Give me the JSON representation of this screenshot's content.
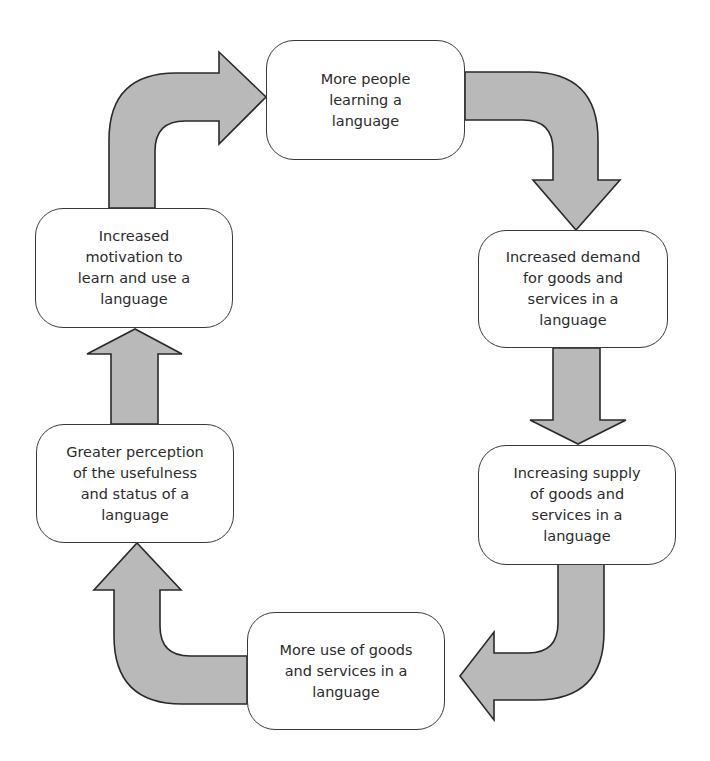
{
  "diagram": {
    "type": "cycle",
    "nodes": [
      {
        "id": "n1",
        "label": "More people\nlearning a\nlanguage"
      },
      {
        "id": "n2",
        "label": "Increased demand\nfor goods and\nservices in a\nlanguage"
      },
      {
        "id": "n3",
        "label": "Increasing supply\nof goods and\nservices in a\nlanguage"
      },
      {
        "id": "n4",
        "label": "More use of goods\nand services in a\nlanguage"
      },
      {
        "id": "n5",
        "label": "Greater perception\nof the usefulness\nand status of a\nlanguage"
      },
      {
        "id": "n6",
        "label": "Increased\nmotivation to\nlearn and use a\nlanguage"
      }
    ],
    "edges": [
      {
        "from": "n1",
        "to": "n2",
        "shape": "curved"
      },
      {
        "from": "n2",
        "to": "n3",
        "shape": "straight"
      },
      {
        "from": "n3",
        "to": "n4",
        "shape": "curved"
      },
      {
        "from": "n4",
        "to": "n5",
        "shape": "curved"
      },
      {
        "from": "n5",
        "to": "n6",
        "shape": "straight"
      },
      {
        "from": "n6",
        "to": "n1",
        "shape": "curved"
      }
    ],
    "colors": {
      "arrow_fill": "#b9b9b9",
      "arrow_stroke": "#2a2a2a",
      "node_fill": "#ffffff",
      "node_border": "#3a3a3a",
      "text": "#2b2b2b"
    }
  }
}
